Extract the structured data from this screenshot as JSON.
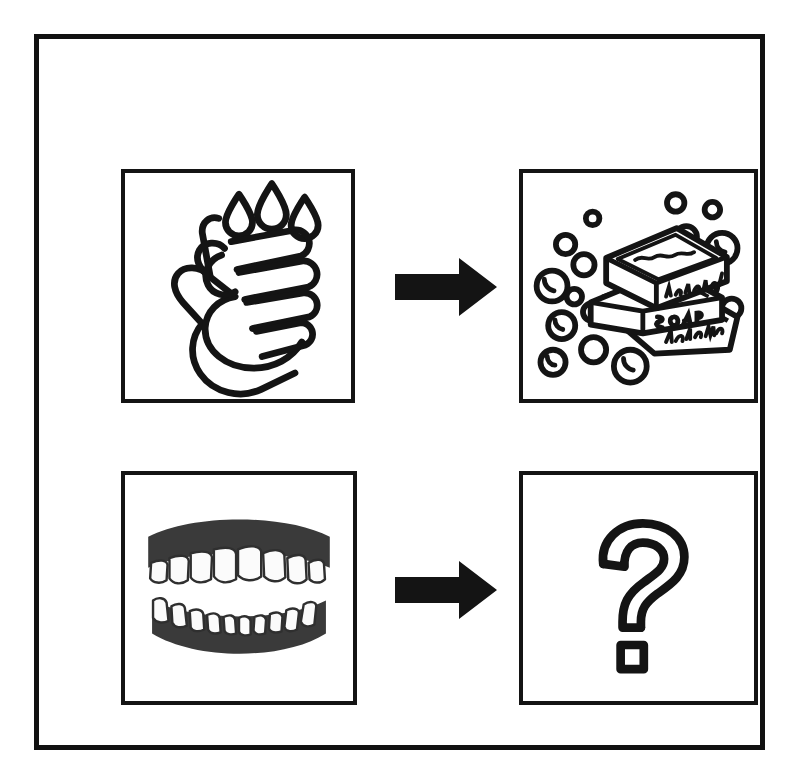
{
  "figure": {
    "kind": "visual-analogy-puzzle",
    "layout": "2x2-grid-with-arrows",
    "border_color": "#111111",
    "background_color": "#ffffff",
    "ink_color": "#141414"
  },
  "rows": [
    {
      "id": "row-hygiene-hands",
      "source": {
        "name": "hand-washing-icon",
        "description": "Two interlocking hands being washed with three water droplets above",
        "droplet_count": 3
      },
      "relation": {
        "name": "arrow-right-icon",
        "glyph": "right-arrow",
        "color": "#141414"
      },
      "target": {
        "name": "soap-bars-icon",
        "description": "Three stacked bars of soap surrounded by bubbles",
        "bar_count": 3,
        "bubble_count": 16,
        "labels": [
          "natural",
          "SOAP",
          "handmade"
        ]
      }
    },
    {
      "id": "row-hygiene-teeth",
      "source": {
        "name": "teeth-icon",
        "description": "Upper and lower dental arches with white teeth and dark gums",
        "upper_teeth_count": 12,
        "lower_teeth_count": 14
      },
      "relation": {
        "name": "arrow-right-icon",
        "glyph": "right-arrow",
        "color": "#141414"
      },
      "target": {
        "name": "question-mark-icon",
        "description": "Large outlined question mark with a square dot indicating the unknown answer",
        "glyph": "?"
      }
    }
  ],
  "soap_text": {
    "top_bar": "natural",
    "middle_bar": "SOAP",
    "bottom_bar": "handmade"
  },
  "answer": {
    "symbol": "?",
    "state": "unknown"
  }
}
